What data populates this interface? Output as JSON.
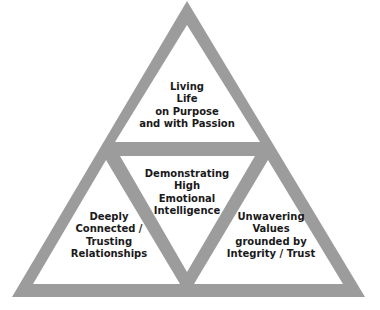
{
  "diagram": {
    "type": "triangle-of-triangles",
    "colors": {
      "frame": "#9c9c9c",
      "fill": "#ffffff",
      "text": "#1a1a1a"
    },
    "sections": {
      "top": {
        "lines": [
          "Living",
          "Life",
          "on Purpose",
          "and with Passion"
        ]
      },
      "center": {
        "lines": [
          "Demonstrating",
          "High",
          "Emotional",
          "Intelligence"
        ]
      },
      "bottom_left": {
        "lines": [
          "Deeply",
          "Connected /",
          "Trusting",
          "Relationships"
        ]
      },
      "bottom_right": {
        "lines": [
          "Unwavering",
          "Values",
          "grounded by",
          "Integrity / Trust"
        ]
      }
    }
  }
}
